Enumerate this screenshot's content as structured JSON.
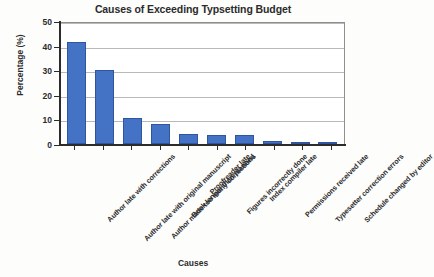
{
  "chart_data": {
    "type": "bar",
    "title": "Causes of Exceeding Typsetting Budget",
    "xlabel": "Causes",
    "ylabel": "Percentage (%)",
    "ylim": [
      0,
      50
    ],
    "yticks": [
      0,
      10,
      20,
      30,
      40,
      50
    ],
    "grid": true,
    "legend": "none",
    "bar_color": "#4472C4",
    "bar_edge_color": "#2F55A0",
    "categories": [
      "Author late with corrections",
      "Author late with original manuscript",
      "Author made too many corrections",
      "Book longer than planned",
      "Proofreader late",
      "Figures incorrectly done",
      "Index compiler late",
      "Permissions received late",
      "Typesetter correction errors",
      "Schedule changed by editor"
    ],
    "values": [
      41.4,
      30.2,
      10.6,
      8.0,
      4.0,
      3.5,
      3.6,
      1.2,
      1.0,
      1.0
    ]
  }
}
